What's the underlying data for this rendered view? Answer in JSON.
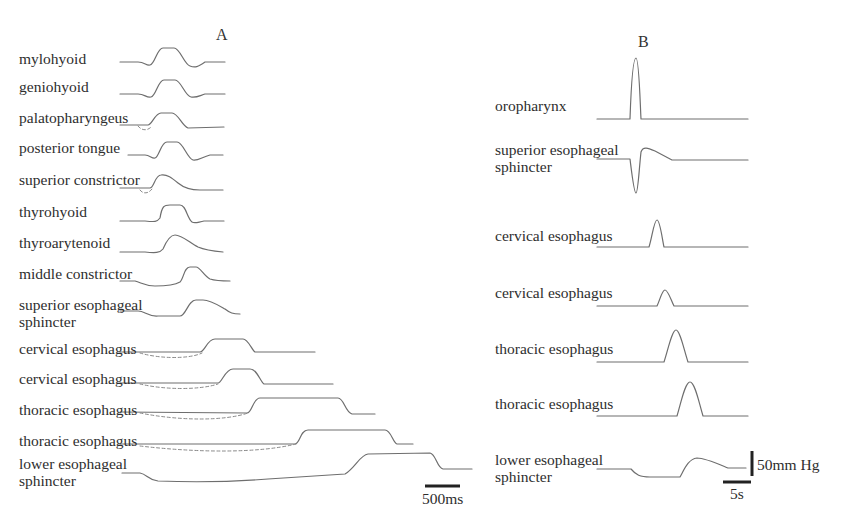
{
  "panels": {
    "A": {
      "label": "A",
      "traces": [
        {
          "name": "mylohyoid",
          "label": "mylohyoid",
          "label_pos": [
            19,
            50
          ],
          "path": "M120,62 L138,62 C145,62 146,66 150,65 C155,64 157,48 163,48 L174,48 C180,48 184,64 190,66 C195,68 198,67 205,62 L225,62"
        },
        {
          "name": "geniohyoid",
          "label": "geniohyoid",
          "label_pos": [
            19,
            78
          ],
          "path": "M120,94 L138,94 C145,94 146,98 151,97 C156,96 158,80 164,80 L175,80 C181,80 185,96 191,97 C196,98 199,96 205,94 L225,94"
        },
        {
          "name": "palatopharyngeus",
          "label": "palatopharyngeus",
          "label_pos": [
            19,
            109
          ],
          "path": "M120,125 L148,125 C152,125 155,113 161,113 L172,113 C178,113 182,126 188,128 L224,127",
          "dashed": "M138,126 C142,131 148,131 152,126"
        },
        {
          "name": "posterior-tongue",
          "label": "posterior tongue",
          "label_pos": [
            19,
            139
          ],
          "path": "M128,155 L145,155 C150,155 152,159 155,158 C159,157 161,142 167,142 L177,142 C183,142 187,158 193,160 C198,161 202,157 210,155 L223,155"
        },
        {
          "name": "superior-constrictor",
          "label": "superior constrictor",
          "label_pos": [
            19,
            171
          ],
          "path": "M120,188 L150,188 C154,188 155,175 161,175 C167,174 172,178 178,183 C184,188 190,190 200,190 L223,190",
          "dashed": "M140,190 C143,194 148,194 152,189"
        },
        {
          "name": "thyrohyoid",
          "label": "thyrohyoid",
          "label_pos": [
            19,
            203
          ],
          "path": "M120,221 L145,221 C155,222 157,222 160,218 C162,206 164,205 170,205 L180,205 C186,205 187,218 192,222 C195,224 198,222 204,221 L224,221"
        },
        {
          "name": "thyroarytenoid",
          "label": "thyroarytenoid",
          "label_pos": [
            19,
            234
          ],
          "path": "M120,252 L145,252 C155,253 160,253 163,249 C166,242 170,235 175,235 C182,235 190,243 198,247 C205,250 212,251 223,252"
        },
        {
          "name": "middle-constrictor",
          "label": "middle constrictor",
          "label_pos": [
            19,
            265
          ],
          "path": "M120,281 L135,281 C142,283 145,286 155,286 C165,286 175,285 180,282 C184,278 184,267 190,267 L196,267 C200,267 204,276 210,279 C216,281 222,281 230,281"
        },
        {
          "name": "superior-esophageal-sphincter",
          "label": "superior esophageal\nsphincter",
          "label_pos": [
            19,
            296
          ],
          "path": "M120,311 L138,311 C145,311 148,317 158,316 L180,316 C186,316 188,300 196,300 L203,300 C210,300 218,305 225,309 C230,313 233,314 240,314"
        },
        {
          "name": "cervical-esophagus-1",
          "label": "cervical esophagus",
          "label_pos": [
            19,
            340
          ],
          "path": "M120,352 L200,352 C205,352 207,339 215,339 L243,339 C248,339 252,350 255,352 L315,352",
          "dashed": "M140,353 C160,359 190,359 202,353"
        },
        {
          "name": "cervical-esophagus-2",
          "label": "cervical esophagus",
          "label_pos": [
            19,
            370
          ],
          "path": "M120,383 L218,383 C222,383 225,369 233,369 L250,369 C257,369 260,381 264,384 L333,384",
          "dashed": "M140,384 C165,390 200,390 218,384"
        },
        {
          "name": "thoracic-esophagus-1",
          "label": "thoracic esophagus",
          "label_pos": [
            19,
            401
          ],
          "path": "M120,412 L247,413 C252,413 253,398 260,398 L338,398 C344,398 345,412 352,414 L375,414",
          "dashed": "M140,413 C180,421 225,421 248,413"
        },
        {
          "name": "thoracic-esophagus-2",
          "label": "thoracic esophagus",
          "label_pos": [
            19,
            432
          ],
          "path": "M120,444 L295,444 C300,444 300,430 308,430 L385,430 C391,430 393,443 397,444 L413,444",
          "dashed": "M140,446 C200,453 260,453 296,444"
        },
        {
          "name": "lower-esophageal-sphincter",
          "label": "lower esophageal\nsphincter",
          "label_pos": [
            19,
            455
          ],
          "path": "M122,473 L140,473 C147,474 148,480 158,481 C185,482 230,482 268,479 L345,474 C355,468 360,455 368,454 L430,453 C436,454 437,468 443,469 L472,469"
        }
      ],
      "scale_bar": {
        "label": "500ms",
        "x1": 425,
        "x2": 460,
        "y": 486,
        "label_pos": [
          422,
          490
        ]
      }
    },
    "B": {
      "label": "B",
      "traces": [
        {
          "name": "oropharynx",
          "label": "oropharynx",
          "label_pos": [
            495,
            97
          ],
          "path": "M597,119 L630,119 C631,90 633,58 636,58 C639,58 640,100 641,119 L748,119"
        },
        {
          "name": "superior-esophageal-sphincter",
          "label": "superior esophageal\nsphincter",
          "label_pos": [
            495,
            141
          ],
          "path": "M597,159 L630,159 C632,175 634,193 636,193 C638,193 639,170 641,152 C643,146 648,148 655,151 L672,160 L748,160"
        },
        {
          "name": "cervical-esophagus-1",
          "label": "cervical esophagus",
          "label_pos": [
            495,
            227
          ],
          "path": "M597,247 L649,247 C652,238 654,220 657,220 C660,220 662,238 664,247 L748,247"
        },
        {
          "name": "cervical-esophagus-2",
          "label": "cervical esophagus",
          "label_pos": [
            495,
            284
          ],
          "path": "M597,306 L657,306 C660,300 662,290 665,290 C668,290 671,300 674,306 L748,306"
        },
        {
          "name": "thoracic-esophagus-1",
          "label": "thoracic esophagus",
          "label_pos": [
            495,
            340
          ],
          "path": "M597,362 L664,362 C668,350 672,330 676,330 C680,330 684,350 688,362 L748,362"
        },
        {
          "name": "thoracic-esophagus-2",
          "label": "thoracic esophagus",
          "label_pos": [
            495,
            395
          ],
          "path": "M597,416 L677,416 C681,403 685,382 690,382 C695,382 699,403 703,416 L748,416"
        },
        {
          "name": "lower-esophageal-sphincter",
          "label": "lower esophageal\nsphincter",
          "label_pos": [
            495,
            451
          ],
          "path": "M597,469 L631,469 C636,475 640,477 650,477 L680,477 C684,470 688,459 697,458 C705,458 716,463 728,468 L746,468"
        }
      ],
      "scale_bar_time": {
        "label": "5s",
        "x1": 723,
        "x2": 751,
        "y": 482,
        "label_pos": [
          730,
          485
        ]
      },
      "scale_bar_pressure": {
        "label": "50mm Hg",
        "x": 752,
        "y1": 451,
        "y2": 476,
        "label_pos": [
          757,
          456
        ]
      }
    }
  }
}
